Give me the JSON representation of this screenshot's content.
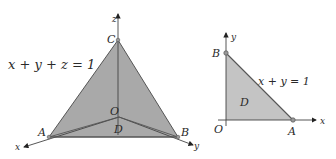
{
  "figure_left": {
    "title": "tetrahedron",
    "equation": "x + y + z = 1",
    "points": {
      "C": "C",
      "A": "A",
      "B": "B",
      "O": "O",
      "D": "D"
    },
    "axes": {
      "x": "x",
      "y": "y",
      "z": "z"
    },
    "fill_color": "#a9a9a9",
    "edge_color": "#555555"
  },
  "figure_right": {
    "title": "triangle region",
    "equation": "x + y = 1",
    "points": {
      "B": "B",
      "A": "A",
      "O": "O",
      "D": "D"
    },
    "axes": {
      "x": "x",
      "y": "y"
    },
    "fill_color": "#c4c4c4",
    "edge_color": "#555555"
  }
}
